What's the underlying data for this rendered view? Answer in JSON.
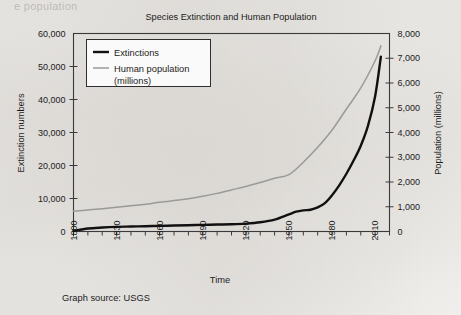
{
  "page": {
    "ghost_line": "e population",
    "background_color": "#f4f3f1"
  },
  "figure": {
    "source_note": "Graph source: USGS"
  },
  "chart_data": {
    "type": "line",
    "title": "Species Extinction and Human Population",
    "xlabel": "Time",
    "ylabel": "Extinction numbers",
    "y2label": "Population (millions)",
    "xlim": [
      1800,
      2020
    ],
    "ylim": [
      0,
      60000
    ],
    "y2lim": [
      0,
      8000
    ],
    "grid": false,
    "legend_position": "top-left",
    "x_major_ticks": [
      1800,
      1830,
      1860,
      1890,
      1920,
      1950,
      1980,
      2010
    ],
    "x_major_tick_labels": [
      "1800",
      "1830",
      "1860",
      "1890",
      "1920",
      "1950",
      "1980",
      "2010"
    ],
    "x_minor_tick_step": 10,
    "y_ticks": [
      0,
      10000,
      20000,
      30000,
      40000,
      50000,
      60000
    ],
    "y_tick_labels": [
      "0",
      "10,000",
      "20,000",
      "30,000",
      "40,000",
      "50,000",
      "60,000"
    ],
    "y2_ticks": [
      0,
      1000,
      2000,
      3000,
      4000,
      5000,
      6000,
      7000,
      8000
    ],
    "y2_tick_labels": [
      "0",
      "1,000",
      "2,000",
      "3,000",
      "4,000",
      "5,000",
      "6,000",
      "7,000",
      "8,000"
    ],
    "series": [
      {
        "name": "Extinctions",
        "axis": "left",
        "color": "#111111",
        "line_width": 2.4,
        "legend_label": "Extinctions",
        "x": [
          1800,
          1810,
          1820,
          1830,
          1840,
          1850,
          1860,
          1870,
          1880,
          1890,
          1900,
          1910,
          1920,
          1930,
          1940,
          1950,
          1955,
          1960,
          1965,
          1970,
          1975,
          1980,
          1985,
          1990,
          1995,
          2000,
          2005,
          2010,
          2014
        ],
        "values": [
          200,
          900,
          1200,
          1400,
          1500,
          1600,
          1700,
          1800,
          1900,
          2000,
          2100,
          2200,
          2400,
          2800,
          3600,
          5200,
          6000,
          6400,
          6600,
          7300,
          8600,
          11000,
          14000,
          17500,
          21500,
          26000,
          32000,
          41000,
          53000
        ]
      },
      {
        "name": "Human population (millions)",
        "axis": "right",
        "color": "#9a9a9a",
        "line_width": 1.5,
        "legend_label": "Human population (millions)",
        "x": [
          1800,
          1810,
          1820,
          1830,
          1840,
          1850,
          1860,
          1870,
          1880,
          1890,
          1900,
          1910,
          1920,
          1930,
          1940,
          1950,
          1960,
          1970,
          1980,
          1990,
          2000,
          2010,
          2014
        ],
        "values": [
          820,
          870,
          920,
          980,
          1040,
          1100,
          1180,
          1250,
          1320,
          1420,
          1540,
          1680,
          1820,
          1980,
          2150,
          2300,
          2800,
          3400,
          4100,
          4950,
          5800,
          6900,
          7500
        ]
      }
    ],
    "legend_entries": [
      {
        "label": "Extinctions",
        "color": "#111111"
      },
      {
        "label": "Human population",
        "color": "#9a9a9a"
      },
      {
        "label": "(millions)",
        "color": "#9a9a9a"
      }
    ]
  }
}
